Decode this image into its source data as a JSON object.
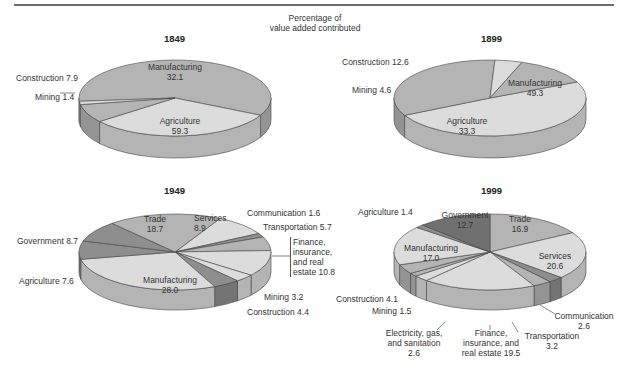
{
  "header": {
    "subtitle_line1": "Percentage of",
    "subtitle_line2": "value added contributed"
  },
  "colors": {
    "light": "#dcdcdc",
    "medium": "#b4b4b4",
    "dark": "#8e8e8e",
    "darker": "#707070"
  },
  "chart_data": [
    {
      "type": "pie",
      "title": "1849",
      "categories": [
        "Agriculture",
        "Manufacturing",
        "Construction",
        "Mining"
      ],
      "values": [
        59.3,
        32.1,
        7.9,
        1.4
      ]
    },
    {
      "type": "pie",
      "title": "1899",
      "categories": [
        "Manufacturing",
        "Agriculture",
        "Mining",
        "Construction"
      ],
      "values": [
        49.3,
        33.3,
        4.6,
        12.6
      ]
    },
    {
      "type": "pie",
      "title": "1949",
      "categories": [
        "Services",
        "Communication",
        "Transportation",
        "Finance, insurance, and real estate",
        "Mining",
        "Construction",
        "Manufacturing",
        "Agriculture",
        "Government",
        "Trade"
      ],
      "values": [
        8.9,
        1.6,
        5.7,
        10.8,
        3.2,
        4.4,
        28.0,
        7.6,
        8.7,
        18.7
      ]
    },
    {
      "type": "pie",
      "title": "1999",
      "categories": [
        "Trade",
        "Services",
        "Communication",
        "Transportation",
        "Finance, insurance, and real estate",
        "Electricity, gas, and sanitation",
        "Mining",
        "Construction",
        "Manufacturing",
        "Agriculture",
        "Government"
      ],
      "values": [
        16.9,
        20.6,
        2.6,
        3.2,
        19.5,
        2.6,
        1.5,
        4.1,
        17.0,
        1.4,
        12.7
      ]
    }
  ],
  "labels": {
    "y1849": {
      "year": "1849",
      "manufacturing": "Manufacturing",
      "manufacturing_v": "32.1",
      "agriculture": "Agriculture",
      "agriculture_v": "59.3",
      "construction": "Construction 7.9",
      "mining": "Mining 1.4"
    },
    "y1899": {
      "year": "1899",
      "manufacturing": "Manufacturing",
      "manufacturing_v": "49.3",
      "agriculture": "Agriculture",
      "agriculture_v": "33.3",
      "construction": "Construction 12.6",
      "mining": "Mining 4.6"
    },
    "y1949": {
      "year": "1949",
      "trade": "Trade",
      "trade_v": "18.7",
      "services": "Services",
      "services_v": "8.9",
      "communication": "Communication 1.6",
      "transportation": "Transportation 5.7",
      "finance_1": "Finance,",
      "finance_2": "insurance,",
      "finance_3": "and real",
      "finance_4": "estate 10.8",
      "government": "Government 8.7",
      "agriculture": "Agriculture 7.6",
      "manufacturing": "Manufacturing",
      "manufacturing_v": "28.0",
      "mining": "Mining 3.2",
      "construction": "Construction 4.4"
    },
    "y1999": {
      "year": "1999",
      "agriculture": "Agriculture 1.4",
      "government": "Government",
      "government_v": "12.7",
      "trade": "Trade",
      "trade_v": "16.9",
      "services": "Services",
      "services_v": "20.6",
      "manufacturing": "Manufacturing",
      "manufacturing_v": "17.0",
      "construction": "Construction 4.1",
      "mining": "Mining 1.5",
      "electricity_1": "Electricity, gas,",
      "electricity_2": "and sanitation",
      "electricity_3": "2.6",
      "finance_1": "Finance,",
      "finance_2": "insurance, and",
      "finance_3": "real estate 19.5",
      "transportation_1": "Transportation",
      "transportation_2": "3.2",
      "communication_1": "Communication",
      "communication_2": "2.6"
    }
  }
}
